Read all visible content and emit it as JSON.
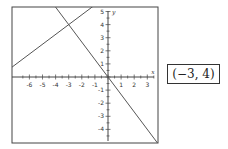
{
  "chart_data": {
    "type": "line",
    "title": "",
    "xlabel": "x",
    "ylabel": "y",
    "xlim": [
      -6.9,
      3.8
    ],
    "ylim": [
      -5.0,
      5.4
    ],
    "x_ticks": [
      -6,
      -5,
      -4,
      -3,
      -2,
      -1,
      1,
      2,
      3
    ],
    "y_ticks": [
      5,
      4,
      3,
      2,
      1,
      -1,
      -2,
      -3,
      -4
    ],
    "grid": false,
    "series": [
      {
        "name": "line-1",
        "equation": "y = 3/4 x + 25/4",
        "slope": 0.75,
        "intercept": 6.25,
        "points": [
          [
            -6.9,
            1.08
          ],
          [
            -1.13,
            5.4
          ]
        ]
      },
      {
        "name": "line-2",
        "equation": "y = -4/3 x",
        "slope": -1.3333,
        "intercept": 0,
        "points": [
          [
            -4.05,
            5.4
          ],
          [
            3.75,
            -5.0
          ]
        ]
      }
    ],
    "intersection": [
      -3,
      4
    ]
  },
  "answer": {
    "label": "(−3, 4)"
  },
  "style": {
    "line_color": "#555555",
    "frame_color": "#444444",
    "text_color": "#333333"
  }
}
